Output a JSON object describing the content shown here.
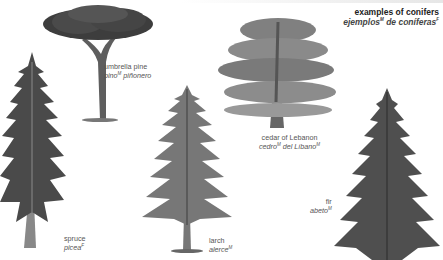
{
  "title": {
    "english": "examples of conifers",
    "spanish": "ejemplos",
    "spanish_gender": "M",
    "spanish_rest": " de coníferas",
    "spanish_rest_gender": "F"
  },
  "trees": [
    {
      "id": "umbrella-pine",
      "english": "umbrella pine",
      "spanish": "pino",
      "spanish_gender": "M",
      "spanish_rest": " piñonero"
    },
    {
      "id": "cedar-of-lebanon",
      "english": "cedar of Lebanon",
      "spanish": "cedro",
      "spanish_gender": "M",
      "spanish_rest": " del Líbano",
      "spanish_rest_gender": "M"
    },
    {
      "id": "spruce",
      "english": "spruce",
      "spanish": "picea",
      "spanish_gender": "F"
    },
    {
      "id": "larch",
      "english": "larch",
      "spanish": "alerce",
      "spanish_gender": "M"
    },
    {
      "id": "fir",
      "english": "fir",
      "spanish": "abeto",
      "spanish_gender": "M"
    }
  ],
  "colors": {
    "foliage_dark": "#3d3d3d",
    "foliage_mid": "#6a6a6a",
    "foliage_light": "#9a9a9a",
    "trunk": "#7a7a7a"
  }
}
